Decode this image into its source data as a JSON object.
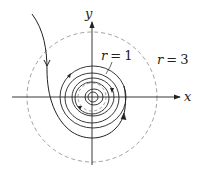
{
  "diagram": {
    "type": "phase-portrait",
    "axes": {
      "x_label": "x",
      "y_label": "y"
    },
    "circles": [
      {
        "label_var": "r",
        "label_eq": "=",
        "label_val": "1",
        "style": "dashed"
      },
      {
        "label_var": "r",
        "label_eq": "=",
        "label_val": "3",
        "style": "dashed"
      }
    ],
    "colors": {
      "stroke": "#222222",
      "dashed": "#777777",
      "background": "#ffffff"
    }
  }
}
